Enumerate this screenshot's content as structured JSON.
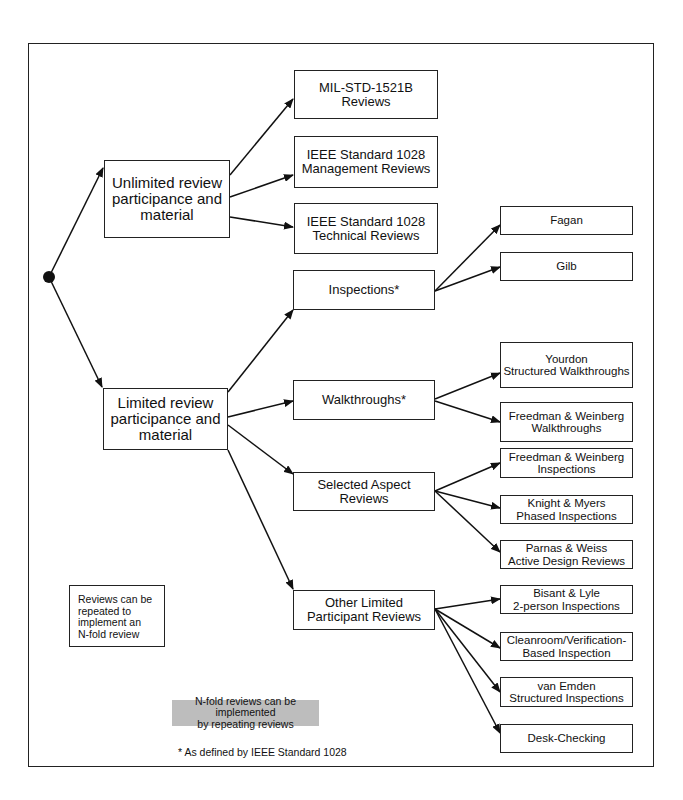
{
  "diagram": {
    "root": {
      "label": "root-node"
    },
    "categories": [
      {
        "id": "unlimited",
        "label": "Unlimited review\nparticipance and\nmaterial",
        "children": [
          {
            "label": "MIL-STD-1521B\nReviews"
          },
          {
            "label": "IEEE Standard 1028\nManagement Reviews"
          },
          {
            "label": "IEEE Standard 1028\nTechnical Reviews"
          }
        ]
      },
      {
        "id": "limited",
        "label": "Limited review\nparticipance and\nmaterial",
        "children": [
          {
            "label": "Inspections*",
            "children": [
              {
                "label": "Fagan"
              },
              {
                "label": "Gilb"
              }
            ]
          },
          {
            "label": "Walkthroughs*",
            "children": [
              {
                "label": "Yourdon\nStructured Walkthroughs"
              },
              {
                "label": "Freedman & Weinberg\nWalkthroughs"
              }
            ]
          },
          {
            "label": "Selected Aspect\nReviews",
            "children": [
              {
                "label": "Freedman & Weinberg\nInspections"
              },
              {
                "label": "Knight & Myers\nPhased Inspections"
              },
              {
                "label": "Parnas & Weiss\nActive Design Reviews"
              }
            ]
          },
          {
            "label": "Other Limited\nParticipant Reviews",
            "children": [
              {
                "label": "Bisant & Lyle\n2-person Inspections"
              },
              {
                "label": "Cleanroom/Verification-\nBased Inspection"
              },
              {
                "label": "van Emden\nStructured Inspections"
              },
              {
                "label": "Desk-Checking"
              }
            ]
          }
        ]
      }
    ],
    "note": "Reviews can be\nrepeated to implement an\nN-fold review",
    "shaded_note": "N-fold reviews can be implemented\nby repeating reviews",
    "footnote": "* As defined by IEEE Standard 1028",
    "colors": {
      "line": "#222222",
      "shade": "#bdbdbd"
    }
  }
}
